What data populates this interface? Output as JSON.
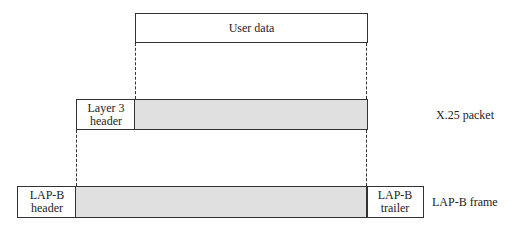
{
  "user_data": {
    "label": "User data"
  },
  "x25_packet": {
    "header_label_line1": "Layer 3",
    "header_label_line2": "header",
    "row_label": "X.25 packet"
  },
  "lapb_frame": {
    "header_line1": "LAP-B",
    "header_line2": "header",
    "trailer_line1": "LAP-B",
    "trailer_line2": "trailer",
    "row_label": "LAP-B frame"
  },
  "colors": {
    "payload_fill": "#e0e0e0",
    "line": "#333333"
  }
}
